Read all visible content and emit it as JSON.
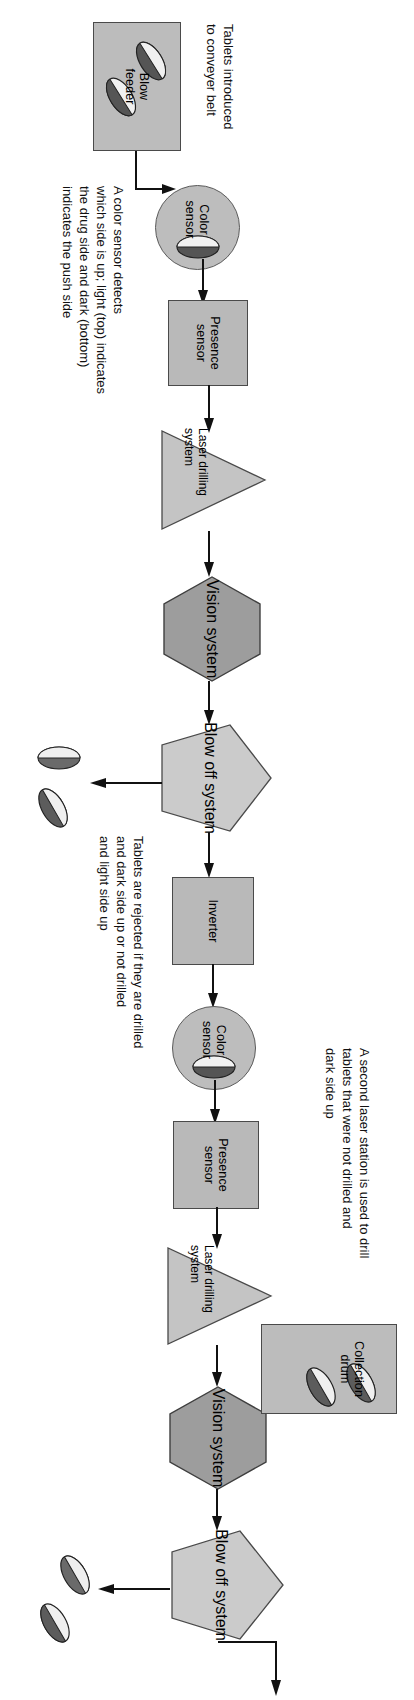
{
  "figure": {
    "orientation": "landscape diagram rotated 90 degrees",
    "colors": {
      "box_fill": "#b9b9b9",
      "hex_fill": "#9a9a9a",
      "pentagon_fill": "#c9c9c9",
      "triangle_fill": "#c4c4c4",
      "circle_fill": "#bdbdbd",
      "outline": "#4a4a4a",
      "text": "#000000",
      "background": "#ffffff"
    }
  },
  "nodes": [
    {
      "id": "blow-feeder",
      "label": "Blow\nfeeder",
      "shape": "rect"
    },
    {
      "id": "color-sensor-1",
      "label": "Color\nsensor",
      "shape": "circle"
    },
    {
      "id": "presence-sensor-1",
      "label": "Presence\nsensor",
      "shape": "rect"
    },
    {
      "id": "laser-drilling-system-1",
      "label": "Laser drilling\nsystem",
      "shape": "triangle"
    },
    {
      "id": "vision-system-1",
      "label": "Vision\nsystem",
      "shape": "hexagon"
    },
    {
      "id": "blow-off-system-1",
      "label": "Blow off\nsystem",
      "shape": "pentagon"
    },
    {
      "id": "inverter",
      "label": "Inverter",
      "shape": "rect"
    },
    {
      "id": "color-sensor-2",
      "label": "Color\nsensor",
      "shape": "circle"
    },
    {
      "id": "presence-sensor-2",
      "label": "Presence\nsensor",
      "shape": "rect"
    },
    {
      "id": "laser-drilling-system-2",
      "label": "Laser drilling\nsystem",
      "shape": "triangle"
    },
    {
      "id": "vision-system-2",
      "label": "Vision\nsystem",
      "shape": "hexagon"
    },
    {
      "id": "blow-off-system-2",
      "label": "Blow off\nsystem",
      "shape": "pentagon"
    },
    {
      "id": "collection-drum",
      "label": "Collection\ndrum",
      "shape": "rect"
    }
  ],
  "labels": {
    "blow_feeder": "Blow\nfeeder",
    "color_sensor_1": "Color\nsensor",
    "presence_sensor_1": "Presence\nsensor",
    "laser_drilling_1": "Laser drilling\nsystem",
    "vision_system_1": "Vision\nsystem",
    "blow_off_1": "Blow off\nsystem",
    "inverter": "Inverter",
    "color_sensor_2": "Color\nsensor",
    "presence_sensor_2": "Presence\nsensor",
    "laser_drilling_2": "Laser drilling\nsystem",
    "vision_system_2": "Vision\nsystem",
    "blow_off_2": "Blow off\nsystem",
    "collection_drum": "Collection\ndrum"
  },
  "annotations": {
    "intro": "Tablets introduced\nto conveyer belt",
    "color_sensor_note": "A color sensor detects\nwhich side is up; light (top) indicates\nthe drug side and dark (bottom)\nindicates the push side",
    "reject_note": "Tablets are rejected if they are drilled\nand dark side up or not drilled\nand light side up",
    "second_laser_note": "A second laser station is used to drill\ntablets that were not drilled and\ndark side up"
  },
  "flow": [
    "blow-feeder -> color-sensor-1",
    "color-sensor-1 -> presence-sensor-1",
    "presence-sensor-1 -> laser-drilling-system-1",
    "laser-drilling-system-1 -> vision-system-1",
    "vision-system-1 -> blow-off-system-1",
    "blow-off-system-1 -> inverter",
    "blow-off-system-1 -> rejected-tablets-1",
    "inverter -> color-sensor-2",
    "color-sensor-2 -> presence-sensor-2",
    "presence-sensor-2 -> laser-drilling-system-2",
    "laser-drilling-system-2 -> vision-system-2",
    "vision-system-2 -> blow-off-system-2",
    "blow-off-system-2 -> collection-drum",
    "blow-off-system-2 -> rejected-tablets-2"
  ]
}
